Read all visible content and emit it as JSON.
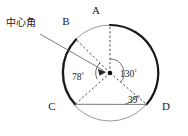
{
  "figure": {
    "title_note": "circle-central-angle-diagram",
    "background_color": "#ffffff",
    "stroke_color": "#1a1a1a",
    "thin_stroke_color": "#8a8a8a",
    "callout": {
      "text": "中心角",
      "x": 6,
      "y": 26
    },
    "vertices": [
      {
        "id": "A",
        "label": "A",
        "lx": 96,
        "ly": 14
      },
      {
        "id": "B",
        "label": "B",
        "lx": 66,
        "ly": 25
      },
      {
        "id": "C",
        "label": "C",
        "lx": 52,
        "ly": 110
      },
      {
        "id": "D",
        "label": "D",
        "lx": 166,
        "ly": 110
      }
    ],
    "angles": [
      {
        "id": "angle-130",
        "value": "130",
        "unit": "°",
        "lx": 120,
        "ly": 77,
        "vertex": "O"
      },
      {
        "id": "angle-78",
        "value": "78",
        "unit": "°",
        "lx": 78,
        "ly": 80,
        "vertex": "O"
      },
      {
        "id": "angle-39",
        "value": "39",
        "unit": "°",
        "lx": 128,
        "ly": 103,
        "vertex": "D"
      }
    ],
    "center": {
      "id": "O",
      "x": 110,
      "y": 73
    },
    "circle": {
      "cx": 110,
      "cy": 73,
      "r": 48
    }
  }
}
